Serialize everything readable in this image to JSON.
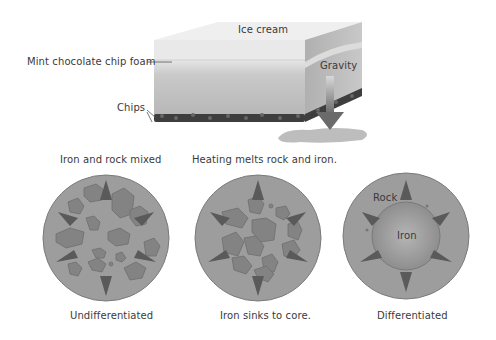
{
  "top_diagram": {
    "title": "Ice cream",
    "labels": {
      "foam": "Mint chocolate chip foam",
      "chips": "Chips",
      "gravity": "Gravity"
    }
  },
  "bottom_diagram": {
    "stages": [
      {
        "caption_top": "Iron and rock mixed",
        "caption_bottom": "Undifferentiated"
      },
      {
        "caption_top": "Heating melts rock and iron.",
        "caption_bottom": "Iron sinks to core."
      },
      {
        "caption_top": "",
        "caption_bottom": "Differentiated",
        "inner_labels": {
          "rock": "Rock",
          "iron": "Iron"
        }
      }
    ]
  },
  "colors": {
    "background": "#ffffff",
    "planet_fill": "#9a9a9a",
    "blob_fill": "#7f7f7f",
    "arrow": "#5a5a5a",
    "chips": "#3a3a3a",
    "ice_cream_top": "#eeeeee",
    "ice_cream_body": "#bdbdbd"
  }
}
